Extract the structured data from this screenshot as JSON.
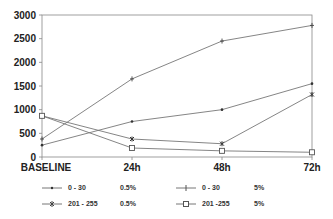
{
  "chart_data": {
    "type": "line",
    "title": "",
    "xlabel": "",
    "ylabel": "",
    "categories": [
      "BASELINE",
      "24h",
      "48h",
      "72h"
    ],
    "ylim": [
      0,
      3000
    ],
    "yticks": [
      0,
      500,
      1000,
      1500,
      2000,
      2500,
      3000
    ],
    "grid": false,
    "legend_position": "bottom",
    "series": [
      {
        "name": "0 - 30 0.5%",
        "range": "0 - 30",
        "conc": "0.5%",
        "marker": "dot",
        "values": [
          250,
          750,
          1000,
          1550
        ]
      },
      {
        "name": "0 - 30 5%",
        "range": "0 - 30",
        "conc": "5%",
        "marker": "plus",
        "values": [
          380,
          1650,
          2450,
          2780
        ]
      },
      {
        "name": "201 - 255 0.5%",
        "range": "201 - 255",
        "conc": "0.5%",
        "marker": "star",
        "values": [
          870,
          380,
          280,
          1320
        ]
      },
      {
        "name": "201 -255 5%",
        "range": "201 -255",
        "conc": "5%",
        "marker": "square",
        "values": [
          870,
          190,
          130,
          100
        ]
      }
    ]
  },
  "legend": [
    {
      "range": "0 - 30",
      "conc": "0.5%"
    },
    {
      "range": "0 - 30",
      "conc": "5%"
    },
    {
      "range": "201 - 255",
      "conc": "0.5%"
    },
    {
      "range": "201 -255",
      "conc": "5%"
    }
  ],
  "colors": {
    "line": "#777777",
    "axis": "#888888",
    "text": "#222222"
  }
}
